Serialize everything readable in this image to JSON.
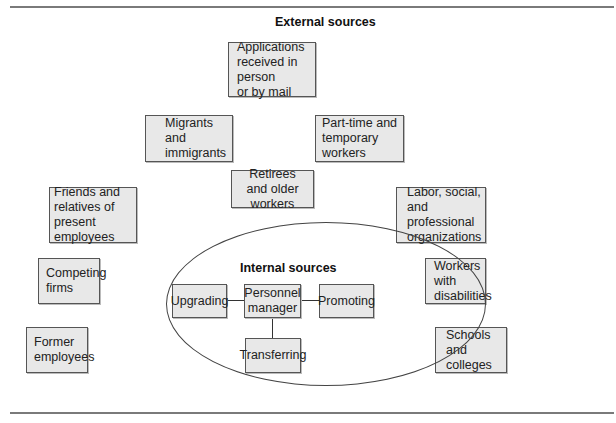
{
  "diagram": {
    "external_heading": "External sources",
    "internal_heading": "Internal sources",
    "external_sources": [
      {
        "id": "applications",
        "label": "Applications\nreceived in person\nor by mail"
      },
      {
        "id": "migrants",
        "label": "Migrants and\nimmigrants"
      },
      {
        "id": "part-time",
        "label": "Part-time and\ntemporary workers"
      },
      {
        "id": "retirees",
        "label": "Retirees\nand older workers"
      },
      {
        "id": "friends",
        "label": "Friends and\nrelatives of\npresent employees"
      },
      {
        "id": "labor",
        "label": "Labor, social,\nand professional\norganizations"
      },
      {
        "id": "competing",
        "label": "Competing\nfirms"
      },
      {
        "id": "disabilities",
        "label": "Workers with\ndisabilities"
      },
      {
        "id": "former",
        "label": "Former\nemployees"
      },
      {
        "id": "schools",
        "label": "Schools and\ncolleges"
      }
    ],
    "internal_sources": {
      "center": "Personnel\nmanager",
      "nodes": [
        {
          "id": "upgrading",
          "label": "Upgrading"
        },
        {
          "id": "promoting",
          "label": "Promoting"
        },
        {
          "id": "transferring",
          "label": "Transferring"
        }
      ]
    }
  }
}
